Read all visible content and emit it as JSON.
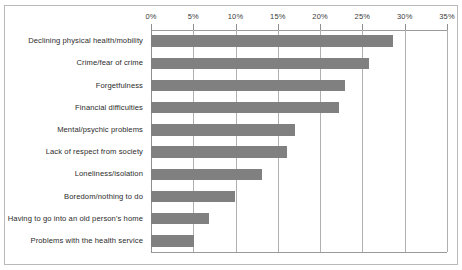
{
  "chart_data": {
    "type": "bar",
    "orientation": "horizontal",
    "title": "",
    "xlabel": "",
    "ylabel": "",
    "xlim": [
      0,
      35
    ],
    "xticks": [
      0,
      5,
      10,
      15,
      20,
      25,
      30,
      35
    ],
    "xtick_labels": [
      "0%",
      "5%",
      "10%",
      "15%",
      "20%",
      "25%",
      "30%",
      "35%"
    ],
    "grid": true,
    "legend": false,
    "bar_color": "#808080",
    "gridline_color": "#b0b0b0",
    "categories": [
      "Declining physical health/mobility",
      "Crime/fear of crime",
      "Forgetfulness",
      "Financial difficulties",
      "Mental/psychic problems",
      "Lack of respect from society",
      "Loneliness/isolation",
      "Boredom/nothing to do",
      "Having to go into an old person's home",
      "Problems with the health service"
    ],
    "values": [
      28.6,
      25.8,
      22.9,
      22.2,
      17.0,
      16.1,
      13.1,
      9.9,
      6.9,
      5.1
    ]
  }
}
